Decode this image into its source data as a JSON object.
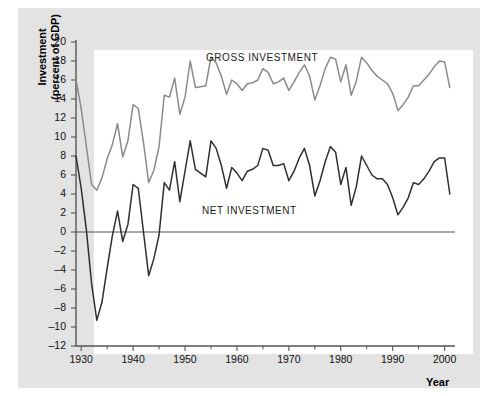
{
  "figure": {
    "background_color": "#e3e3e3",
    "plot_background_color": "#ffffff"
  },
  "axis_titles": {
    "y_line1": "Investment",
    "y_line2": "(percent of GDP)",
    "x": "Year"
  },
  "series_labels": {
    "gross": "GROSS INVESTMENT",
    "net": "NET INVESTMENT"
  },
  "chart_data": {
    "type": "line",
    "title": "",
    "subtitle": "",
    "xlabel": "Year",
    "ylabel": "Investment (percent of GDP)",
    "xlim": [
      1929,
      2002
    ],
    "ylim": [
      -12,
      20
    ],
    "grid": false,
    "legend_position": "inline-annotation",
    "zero_line": 0,
    "x_ticks_major": [
      1930,
      1940,
      1950,
      1960,
      1970,
      1980,
      1990,
      2000
    ],
    "x_tick_labels": [
      "1930",
      "1940",
      "1950",
      "1960",
      "1970",
      "1980",
      "1990",
      "2000"
    ],
    "x_ticks_minor": [
      1935,
      1945,
      1955,
      1965,
      1975,
      1985,
      1995
    ],
    "y_ticks": [
      -12,
      -10,
      -8,
      -6,
      -4,
      -2,
      0,
      2,
      4,
      6,
      8,
      10,
      12,
      14,
      16,
      18,
      20
    ],
    "y_tick_labels": [
      "–12",
      "–10",
      "–8",
      "–6",
      "–4",
      "–2",
      "0",
      "2",
      "4",
      "6",
      "8",
      "10",
      "12",
      "14",
      "16",
      "18",
      "20"
    ],
    "colors": {
      "gross": "#8a8a8a",
      "net": "#2f2f2f",
      "axis": "#555555",
      "zero_line": "#555555"
    },
    "x": [
      1929,
      1930,
      1931,
      1932,
      1933,
      1934,
      1935,
      1936,
      1937,
      1938,
      1939,
      1940,
      1941,
      1942,
      1943,
      1944,
      1945,
      1946,
      1947,
      1948,
      1949,
      1950,
      1951,
      1952,
      1953,
      1954,
      1955,
      1956,
      1957,
      1958,
      1959,
      1960,
      1961,
      1962,
      1963,
      1964,
      1965,
      1966,
      1967,
      1968,
      1969,
      1970,
      1971,
      1972,
      1973,
      1974,
      1975,
      1976,
      1977,
      1978,
      1979,
      1980,
      1981,
      1982,
      1983,
      1984,
      1985,
      1986,
      1987,
      1988,
      1989,
      1990,
      1991,
      1992,
      1993,
      1994,
      1995,
      1996,
      1997,
      1998,
      1999,
      2000,
      2001
    ],
    "series": [
      {
        "name": "GROSS INVESTMENT",
        "color": "#8a8a8a",
        "values": [
          16.0,
          13.0,
          9.0,
          5.0,
          4.4,
          5.7,
          7.7,
          9.2,
          11.4,
          7.9,
          9.6,
          13.4,
          13.0,
          9.4,
          5.2,
          6.5,
          9.0,
          14.4,
          14.2,
          16.2,
          12.4,
          14.2,
          18.0,
          15.2,
          15.3,
          15.4,
          18.4,
          17.8,
          16.4,
          14.5,
          16.0,
          15.6,
          14.9,
          15.6,
          15.7,
          16.0,
          17.2,
          16.8,
          15.6,
          15.8,
          16.2,
          14.9,
          15.8,
          16.8,
          17.6,
          16.4,
          13.9,
          15.4,
          17.2,
          18.4,
          18.2,
          15.8,
          17.6,
          14.4,
          15.9,
          18.4,
          17.8,
          17.0,
          16.4,
          16.0,
          15.6,
          14.6,
          12.8,
          13.4,
          14.2,
          15.4,
          15.4,
          16.0,
          16.6,
          17.4,
          18.0,
          17.9,
          15.2
        ]
      },
      {
        "name": "NET INVESTMENT",
        "color": "#2f2f2f",
        "values": [
          8.0,
          4.6,
          0.2,
          -5.4,
          -9.3,
          -7.4,
          -3.8,
          -0.4,
          2.2,
          -1.0,
          0.8,
          5.0,
          4.6,
          0.0,
          -4.6,
          -2.8,
          -0.3,
          5.2,
          4.4,
          7.4,
          3.2,
          6.4,
          9.6,
          6.6,
          6.2,
          5.8,
          9.6,
          8.8,
          7.0,
          4.6,
          6.8,
          6.2,
          5.4,
          6.4,
          6.6,
          7.0,
          8.8,
          8.6,
          7.0,
          7.0,
          7.2,
          5.4,
          6.4,
          7.8,
          8.8,
          7.0,
          3.8,
          5.4,
          7.4,
          9.0,
          8.4,
          5.0,
          6.8,
          2.8,
          4.8,
          8.0,
          7.0,
          6.0,
          5.6,
          5.6,
          5.0,
          3.6,
          1.8,
          2.6,
          3.6,
          5.2,
          5.0,
          5.6,
          6.4,
          7.4,
          7.8,
          7.8,
          4.0
        ]
      }
    ]
  }
}
